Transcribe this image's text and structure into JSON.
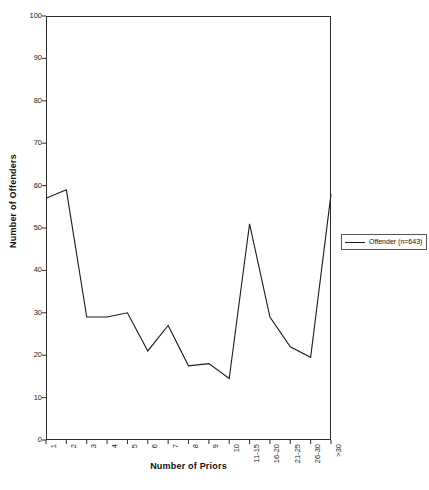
{
  "chart_data": {
    "type": "line",
    "title": "",
    "xlabel": "Number of Priors",
    "ylabel": "Number of Offenders",
    "categories": [
      "1",
      "2",
      "3",
      "4",
      "5",
      "6",
      "7",
      "8",
      "9",
      "10",
      "11-15",
      "16-20",
      "21-25",
      "26-30",
      ">30"
    ],
    "series": [
      {
        "name": "Offender (n=643)",
        "values": [
          57,
          59,
          29,
          29,
          30,
          21,
          27,
          17.5,
          18,
          14.5,
          51,
          29,
          22,
          19.5,
          58
        ]
      }
    ],
    "ylim": [
      0,
      100
    ],
    "yticks": [
      0,
      10,
      20,
      30,
      40,
      50,
      60,
      70,
      80,
      90,
      100
    ],
    "ytick_labels": [
      "0",
      "10",
      "20",
      "30",
      "40",
      "50",
      "60",
      "70",
      "80",
      "90",
      "100"
    ],
    "grid": false,
    "legend_position": "right",
    "line_color": "#1a1a1a",
    "frame_color": "#2b2b2b",
    "background": "#ffffff"
  },
  "legend": {
    "entries": [
      {
        "label": "Offender (n=643)",
        "swatch_name": "legend-line-swatch"
      }
    ]
  },
  "axes": {
    "y_title": "Number of Offenders",
    "x_title": "Number of Priors"
  }
}
